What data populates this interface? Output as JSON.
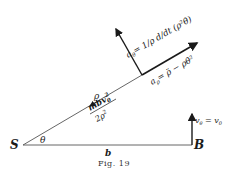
{
  "figure": {
    "caption": "Fig. 19",
    "points": {
      "S": "S",
      "B": "B"
    },
    "labels": {
      "theta": "θ",
      "b": "b",
      "rho": "ρ",
      "force_num": "mbv",
      "force_num_sub": "0",
      "force_num_sup": "2",
      "force_den": "2ρ",
      "force_den_sup": "2",
      "a_theta_lhs": "a",
      "a_theta_sub": "θ",
      "a_theta_rhs": "= 1/ρ d/dt (ρ²θ̇)",
      "a_rho_lhs": "a",
      "a_rho_sub": "ρ",
      "a_rho_rhs": "= ρ̈ − ρθ̇²",
      "v_theta": "v",
      "v_theta_sub": "θ",
      "v_theta_rhs": " = v",
      "v_theta_rhs_sub": "0"
    },
    "colors": {
      "ink": "#1a1a1a",
      "line": "#444444"
    }
  }
}
